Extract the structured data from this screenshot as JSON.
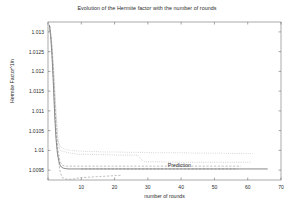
{
  "chart_data": {
    "type": "line",
    "title": "Evolution of the Hermite factor with the number of rounds",
    "xlabel": "number of rounds",
    "ylabel": "Hermite Factor^1/n",
    "xlim": [
      0,
      70
    ],
    "ylim": [
      1.00925,
      1.01325
    ],
    "grid": false,
    "legend": "none",
    "xticks": [
      0,
      10,
      20,
      30,
      40,
      50,
      60,
      70
    ],
    "xtick_labels": [
      "",
      "10",
      "20",
      "30",
      "40",
      "50",
      "60",
      "70"
    ],
    "yticks": [
      1.0095,
      1.01,
      1.0105,
      1.011,
      1.0115,
      1.012,
      1.0125,
      1.013
    ],
    "ytick_labels": [
      "1.0095",
      "1.01",
      "1.0105",
      "1.011",
      "1.0115",
      "1.012",
      "1.0125",
      "1.013"
    ],
    "annotations": [
      {
        "text": "Prediction",
        "x": 36,
        "y": 1.00963
      }
    ],
    "series": [
      {
        "name": "run-solid-main",
        "style": "solid",
        "color": "#555555",
        "x": [
          0.4,
          0.8,
          1.2,
          1.6,
          2.0,
          2.4,
          2.8,
          3.2,
          3.6,
          4.0,
          4.6,
          5.2,
          6.0,
          7.0,
          8.0,
          10.0,
          12.0,
          15.0,
          20.0,
          25.0,
          30.0,
          35.0,
          40.0,
          45.0,
          50.0,
          55.0,
          60.0,
          63.0,
          66.0
        ],
        "y": [
          1.01318,
          1.0129,
          1.0124,
          1.0117,
          1.0109,
          1.0103,
          1.00995,
          1.00975,
          1.00963,
          1.00958,
          1.00955,
          1.00954,
          1.00953,
          1.00953,
          1.00953,
          1.00953,
          1.00953,
          1.00953,
          1.00953,
          1.00953,
          1.00953,
          1.00953,
          1.00953,
          1.00953,
          1.00953,
          1.00953,
          1.00953,
          1.00953,
          1.00953
        ]
      },
      {
        "name": "run-dashed-low",
        "style": "dashed",
        "color": "#8a8a8a",
        "x": [
          0.5,
          1.0,
          1.5,
          2.0,
          2.5,
          3.0,
          3.6,
          4.2,
          5.0,
          6.0,
          7.0,
          8.0,
          9.0,
          10.0,
          12.0,
          14.0,
          16.0,
          18.0,
          20.0,
          22.0
        ],
        "y": [
          1.01315,
          1.01275,
          1.01205,
          1.01115,
          1.01035,
          1.00985,
          1.00948,
          1.00932,
          1.00928,
          1.00927,
          1.00927,
          1.00928,
          1.0093,
          1.00931,
          1.00932,
          1.00933,
          1.00934,
          1.00935,
          1.00936,
          1.00937
        ]
      },
      {
        "name": "run-dashed-mid",
        "style": "dashed",
        "color": "#8a8a8a",
        "x": [
          0.5,
          1.0,
          1.5,
          2.0,
          2.5,
          3.0,
          3.6,
          4.4,
          5.5,
          7.0,
          9.0,
          11.0,
          13.0,
          16.0,
          20.0,
          24.0,
          28.0,
          32.0,
          36.0,
          40.0,
          45.0,
          50.0,
          55.0,
          58.0
        ],
        "y": [
          1.01316,
          1.01282,
          1.01218,
          1.0113,
          1.0105,
          1.01,
          1.00972,
          1.00962,
          1.0096,
          1.0096,
          1.0096,
          1.0096,
          1.0096,
          1.0096,
          1.0096,
          1.0096,
          1.0096,
          1.0096,
          1.0096,
          1.0096,
          1.0096,
          1.0096,
          1.0096,
          1.0096
        ]
      },
      {
        "name": "run-dotted-upper",
        "style": "dotted",
        "color": "#999999",
        "x": [
          0.6,
          1.2,
          1.8,
          2.4,
          3.0,
          3.6,
          4.4,
          5.2,
          6.2,
          7.5,
          9.0,
          11.0,
          13.0,
          15.0,
          18.0,
          21.0,
          24.0,
          27.0,
          28.5,
          30.0,
          34.0,
          38.0,
          42.0,
          46.0,
          50.0,
          54.0,
          58.0,
          60.0,
          61.0
        ],
        "y": [
          1.01312,
          1.01268,
          1.01192,
          1.011,
          1.01028,
          1.01,
          1.00998,
          1.00996,
          1.00994,
          1.00992,
          1.0099,
          1.0099,
          1.0099,
          1.00989,
          1.00989,
          1.00988,
          1.00988,
          1.00988,
          1.00972,
          1.00971,
          1.00971,
          1.0097,
          1.0097,
          1.0097,
          1.0097,
          1.0097,
          1.0097,
          1.0097,
          1.0097
        ]
      },
      {
        "name": "run-dotted-upper2",
        "style": "dotted",
        "color": "#a5a5a5",
        "x": [
          0.6,
          1.2,
          1.8,
          2.4,
          3.0,
          3.8,
          4.6,
          5.6,
          6.8,
          8.2,
          10.0,
          12.0,
          14.0,
          17.0,
          20.0,
          24.0,
          28.0,
          32.0,
          36.0,
          40.0,
          44.0,
          48.0,
          52.0,
          56.0,
          60.0,
          61.5
        ],
        "y": [
          1.0131,
          1.01262,
          1.01185,
          1.01092,
          1.01022,
          1.01008,
          1.01005,
          1.01002,
          1.01,
          1.00999,
          1.00998,
          1.00997,
          1.00997,
          1.00996,
          1.00996,
          1.00995,
          1.00995,
          1.00994,
          1.00994,
          1.00994,
          1.00993,
          1.00993,
          1.00993,
          1.00992,
          1.00992,
          1.00992
        ]
      },
      {
        "name": "prediction-line",
        "style": "dashed",
        "color": "#7a7a7a",
        "x": [
          10.0,
          15.0,
          20.0,
          25.0,
          30.0,
          35.0,
          40.0,
          45.0,
          50.0,
          55.0,
          57.0
        ],
        "y": [
          1.00953,
          1.00953,
          1.00953,
          1.00953,
          1.00953,
          1.00953,
          1.00953,
          1.00953,
          1.00953,
          1.00953,
          1.00953
        ]
      }
    ]
  }
}
